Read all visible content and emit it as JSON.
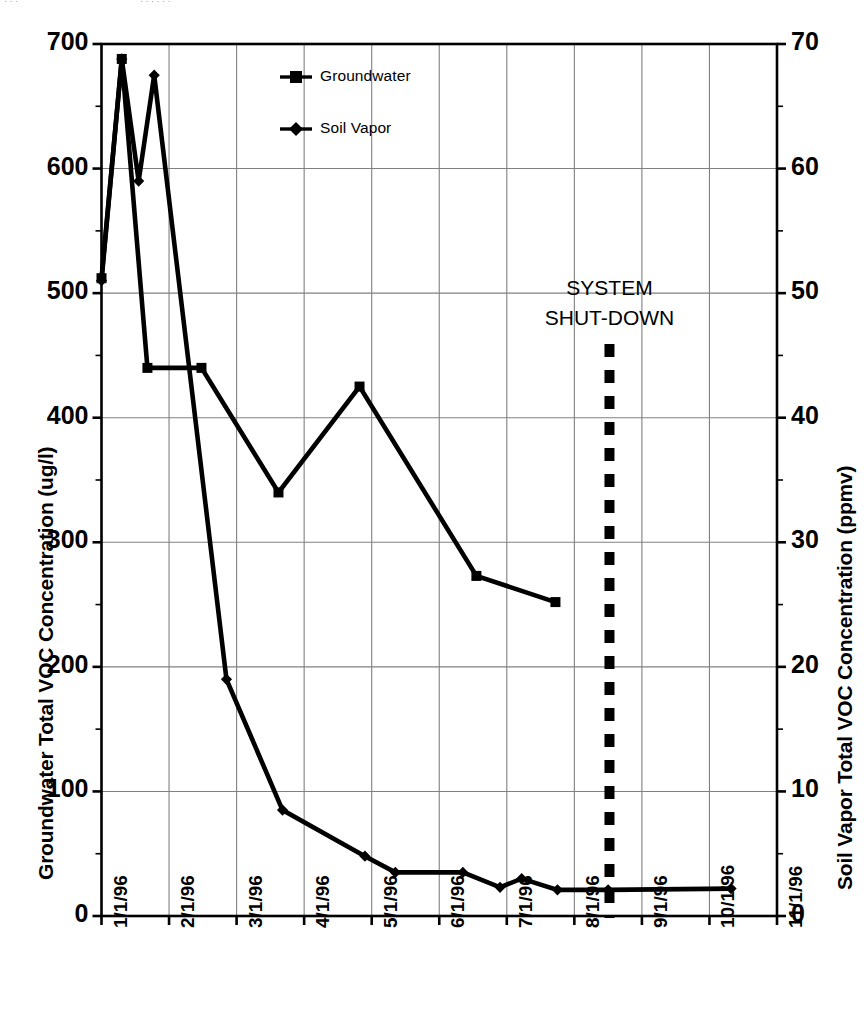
{
  "chart_data": {
    "type": "line",
    "title": "",
    "xlabel": "",
    "x_tick_labels": [
      "1/1/96",
      "2/1/96",
      "3/1/96",
      "4/1/96",
      "5/1/96",
      "6/1/96",
      "7/1/96",
      "8/1/96",
      "9/1/96",
      "10/1/96",
      "11/1/96"
    ],
    "xlim": [
      0,
      10
    ],
    "grid": true,
    "legend_position": "top-center",
    "axes": [
      {
        "side": "left",
        "label": "Groundwater Total VOC Concentration (ug/l)",
        "ticks": [
          0,
          100,
          200,
          300,
          400,
          500,
          600,
          700
        ],
        "tick_labels": [
          "0",
          "100",
          "200",
          "300",
          "400",
          "500",
          "600",
          "700"
        ],
        "ylim": [
          0,
          700
        ],
        "minor_tick_step": 50
      },
      {
        "side": "right",
        "label": "Soil Vapor Total VOC Concentration (ppmv)",
        "ticks": [
          0,
          10,
          20,
          30,
          40,
          50,
          60,
          70
        ],
        "tick_labels": [
          "0",
          "10",
          "20",
          "30",
          "40",
          "50",
          "60",
          "70"
        ],
        "ylim": [
          0,
          70
        ],
        "minor_tick_step": 5
      }
    ],
    "series": [
      {
        "name": "Groundwater",
        "axis": "left",
        "marker": "square",
        "units": "ug/l",
        "points": [
          {
            "x": "1/1/96",
            "x_num": 0.0,
            "y": 512
          },
          {
            "x": "1/10/96",
            "x_num": 0.3,
            "y": 688
          },
          {
            "x": "1/22/96",
            "x_num": 0.68,
            "y": 440
          },
          {
            "x": "2/15/96",
            "x_num": 1.48,
            "y": 440
          },
          {
            "x": "3/20/96",
            "x_num": 2.62,
            "y": 340
          },
          {
            "x": "4/25/96",
            "x_num": 3.82,
            "y": 425
          },
          {
            "x": "6/20/96",
            "x_num": 5.55,
            "y": 273
          },
          {
            "x": "7/25/96",
            "x_num": 6.72,
            "y": 252
          }
        ]
      },
      {
        "name": "Soil Vapor",
        "axis": "right",
        "marker": "diamond",
        "units": "ppmv",
        "points": [
          {
            "x": "1/1/96",
            "x_num": 0.0,
            "y": 51.0
          },
          {
            "x": "1/10/96",
            "x_num": 0.3,
            "y": 68.8
          },
          {
            "x": "1/18/96",
            "x_num": 0.55,
            "y": 59.0
          },
          {
            "x": "1/26/96",
            "x_num": 0.78,
            "y": 67.5
          },
          {
            "x": "2/26/96",
            "x_num": 1.85,
            "y": 19.0
          },
          {
            "x": "3/22/96",
            "x_num": 2.68,
            "y": 8.5
          },
          {
            "x": "4/28/96",
            "x_num": 3.9,
            "y": 4.8
          },
          {
            "x": "5/12/96",
            "x_num": 4.35,
            "y": 3.5
          },
          {
            "x": "6/12/96",
            "x_num": 5.35,
            "y": 3.5
          },
          {
            "x": "6/28/96",
            "x_num": 5.9,
            "y": 2.3
          },
          {
            "x": "7/8/96",
            "x_num": 6.22,
            "y": 3.0
          },
          {
            "x": "7/26/96",
            "x_num": 6.75,
            "y": 2.1
          },
          {
            "x": "8/16/96",
            "x_num": 7.5,
            "y": 2.1
          },
          {
            "x": "10/12/96",
            "x_num": 9.32,
            "y": 2.2
          }
        ]
      }
    ],
    "annotations": [
      {
        "name": "system-shutdown",
        "text_line1": "SYSTEM",
        "text_line2": "SHUT-DOWN",
        "x_num": 7.52,
        "style": "thick dashed vertical line",
        "color": "#000000"
      }
    ]
  },
  "legend": {
    "items": [
      {
        "label": "Groundwater",
        "marker": "square"
      },
      {
        "label": "Soil Vapor",
        "marker": "diamond"
      }
    ]
  },
  "colors": {
    "line": "#000000",
    "grid": "#808080",
    "axis": "#000000",
    "background": "#ffffff"
  }
}
